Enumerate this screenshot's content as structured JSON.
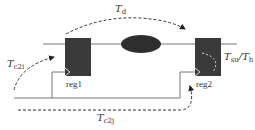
{
  "diagram": {
    "registers": [
      {
        "id": "reg1",
        "label": "reg1"
      },
      {
        "id": "reg2",
        "label": "reg2"
      }
    ],
    "combinational_logic": {
      "shape": "ellipse"
    },
    "labels": {
      "data_delay": {
        "main": "T",
        "sub": "d"
      },
      "clock_to_reg1": {
        "main": "T",
        "sub": "c2i"
      },
      "clock_to_reg2": {
        "main": "T",
        "sub": "c2j"
      },
      "setup_hold": {
        "main1": "T",
        "sub1": "su",
        "sep": "/",
        "main2": "T",
        "sub2": "h"
      }
    },
    "colors": {
      "register_fill": "#3a3a3a",
      "logic_fill": "#2e2e2e",
      "wire": "#777777",
      "text": "#333333"
    }
  }
}
